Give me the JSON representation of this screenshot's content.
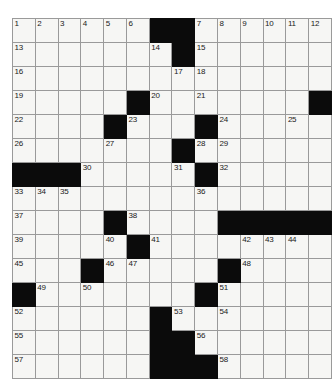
{
  "puzzle": {
    "title": "Crossword Grid",
    "columns": 13,
    "rows": 13,
    "cell_size_px": 24,
    "colors": {
      "block": "#0b0b0b",
      "open_cell": "#f6f6f4",
      "grid_line": "#9a9a9a",
      "number_text": "#1a1a1a",
      "page_background": "#ffffff"
    },
    "max_clue_number": 58,
    "grid": [
      [
        {
          "type": "open",
          "number": "1"
        },
        {
          "type": "open",
          "number": "2"
        },
        {
          "type": "open",
          "number": "3"
        },
        {
          "type": "open",
          "number": "4"
        },
        {
          "type": "open",
          "number": "5"
        },
        {
          "type": "open",
          "number": "6"
        },
        {
          "type": "block",
          "number": ""
        },
        {
          "type": "block",
          "number": ""
        },
        {
          "type": "open",
          "number": "7"
        },
        {
          "type": "open",
          "number": "8"
        },
        {
          "type": "open",
          "number": "9"
        },
        {
          "type": "open",
          "number": "10"
        },
        {
          "type": "open",
          "number": "11"
        },
        {
          "type": "open",
          "number": "12"
        }
      ],
      [
        {
          "type": "open",
          "number": "13"
        },
        {
          "type": "open",
          "number": ""
        },
        {
          "type": "open",
          "number": ""
        },
        {
          "type": "open",
          "number": ""
        },
        {
          "type": "open",
          "number": ""
        },
        {
          "type": "open",
          "number": ""
        },
        {
          "type": "open",
          "number": "14"
        },
        {
          "type": "block",
          "number": ""
        },
        {
          "type": "open",
          "number": "15"
        },
        {
          "type": "open",
          "number": ""
        },
        {
          "type": "open",
          "number": ""
        },
        {
          "type": "open",
          "number": ""
        },
        {
          "type": "open",
          "number": ""
        },
        {
          "type": "open",
          "number": ""
        }
      ],
      [
        {
          "type": "open",
          "number": "16"
        },
        {
          "type": "open",
          "number": ""
        },
        {
          "type": "open",
          "number": ""
        },
        {
          "type": "open",
          "number": ""
        },
        {
          "type": "open",
          "number": ""
        },
        {
          "type": "open",
          "number": ""
        },
        {
          "type": "open",
          "number": ""
        },
        {
          "type": "open",
          "number": "17"
        },
        {
          "type": "open",
          "number": "18"
        },
        {
          "type": "open",
          "number": ""
        },
        {
          "type": "open",
          "number": ""
        },
        {
          "type": "open",
          "number": ""
        },
        {
          "type": "open",
          "number": ""
        },
        {
          "type": "open",
          "number": ""
        }
      ],
      [
        {
          "type": "open",
          "number": "19"
        },
        {
          "type": "open",
          "number": ""
        },
        {
          "type": "open",
          "number": ""
        },
        {
          "type": "open",
          "number": ""
        },
        {
          "type": "open",
          "number": ""
        },
        {
          "type": "block",
          "number": ""
        },
        {
          "type": "open",
          "number": "20"
        },
        {
          "type": "open",
          "number": ""
        },
        {
          "type": "open",
          "number": "21"
        },
        {
          "type": "open",
          "number": ""
        },
        {
          "type": "open",
          "number": ""
        },
        {
          "type": "open",
          "number": ""
        },
        {
          "type": "open",
          "number": ""
        },
        {
          "type": "block",
          "number": ""
        }
      ],
      [
        {
          "type": "open",
          "number": "22"
        },
        {
          "type": "open",
          "number": ""
        },
        {
          "type": "open",
          "number": ""
        },
        {
          "type": "open",
          "number": ""
        },
        {
          "type": "block",
          "number": ""
        },
        {
          "type": "open",
          "number": "23"
        },
        {
          "type": "open",
          "number": ""
        },
        {
          "type": "open",
          "number": ""
        },
        {
          "type": "block",
          "number": ""
        },
        {
          "type": "open",
          "number": "24"
        },
        {
          "type": "open",
          "number": ""
        },
        {
          "type": "open",
          "number": ""
        },
        {
          "type": "open",
          "number": "25"
        },
        {
          "type": "open",
          "number": ""
        }
      ],
      [
        {
          "type": "open",
          "number": "26"
        },
        {
          "type": "open",
          "number": ""
        },
        {
          "type": "open",
          "number": ""
        },
        {
          "type": "open",
          "number": ""
        },
        {
          "type": "open",
          "number": "27"
        },
        {
          "type": "open",
          "number": ""
        },
        {
          "type": "open",
          "number": ""
        },
        {
          "type": "block",
          "number": ""
        },
        {
          "type": "open",
          "number": "28"
        },
        {
          "type": "open",
          "number": "29"
        },
        {
          "type": "open",
          "number": ""
        },
        {
          "type": "open",
          "number": ""
        },
        {
          "type": "open",
          "number": ""
        },
        {
          "type": "open",
          "number": ""
        }
      ],
      [
        {
          "type": "block",
          "number": ""
        },
        {
          "type": "block",
          "number": ""
        },
        {
          "type": "block",
          "number": ""
        },
        {
          "type": "open",
          "number": "30"
        },
        {
          "type": "open",
          "number": ""
        },
        {
          "type": "open",
          "number": ""
        },
        {
          "type": "open",
          "number": ""
        },
        {
          "type": "open",
          "number": "31"
        },
        {
          "type": "block",
          "number": ""
        },
        {
          "type": "open",
          "number": "32"
        },
        {
          "type": "open",
          "number": ""
        },
        {
          "type": "open",
          "number": ""
        },
        {
          "type": "open",
          "number": ""
        },
        {
          "type": "open",
          "number": ""
        }
      ],
      [
        {
          "type": "open",
          "number": "33"
        },
        {
          "type": "open",
          "number": "34"
        },
        {
          "type": "open",
          "number": "35"
        },
        {
          "type": "open",
          "number": ""
        },
        {
          "type": "open",
          "number": ""
        },
        {
          "type": "open",
          "number": ""
        },
        {
          "type": "open",
          "number": ""
        },
        {
          "type": "open",
          "number": ""
        },
        {
          "type": "open",
          "number": "36"
        },
        {
          "type": "open",
          "number": ""
        },
        {
          "type": "open",
          "number": ""
        },
        {
          "type": "open",
          "number": ""
        },
        {
          "type": "open",
          "number": ""
        },
        {
          "type": "open",
          "number": ""
        }
      ],
      [
        {
          "type": "open",
          "number": "37"
        },
        {
          "type": "open",
          "number": ""
        },
        {
          "type": "open",
          "number": ""
        },
        {
          "type": "open",
          "number": ""
        },
        {
          "type": "block",
          "number": ""
        },
        {
          "type": "open",
          "number": "38"
        },
        {
          "type": "open",
          "number": ""
        },
        {
          "type": "open",
          "number": ""
        },
        {
          "type": "open",
          "number": ""
        },
        {
          "type": "block",
          "number": ""
        },
        {
          "type": "block",
          "number": ""
        },
        {
          "type": "block",
          "number": ""
        },
        {
          "type": "block",
          "number": ""
        },
        {
          "type": "block",
          "number": ""
        }
      ],
      [
        {
          "type": "open",
          "number": "39"
        },
        {
          "type": "open",
          "number": ""
        },
        {
          "type": "open",
          "number": ""
        },
        {
          "type": "open",
          "number": ""
        },
        {
          "type": "open",
          "number": "40"
        },
        {
          "type": "block",
          "number": ""
        },
        {
          "type": "open",
          "number": "41"
        },
        {
          "type": "open",
          "number": ""
        },
        {
          "type": "open",
          "number": ""
        },
        {
          "type": "open",
          "number": ""
        },
        {
          "type": "open",
          "number": "42"
        },
        {
          "type": "open",
          "number": "43"
        },
        {
          "type": "open",
          "number": "44"
        },
        {
          "type": "open",
          "number": ""
        }
      ],
      [
        {
          "type": "open",
          "number": "45"
        },
        {
          "type": "open",
          "number": ""
        },
        {
          "type": "open",
          "number": ""
        },
        {
          "type": "block",
          "number": ""
        },
        {
          "type": "open",
          "number": "46"
        },
        {
          "type": "open",
          "number": "47"
        },
        {
          "type": "open",
          "number": ""
        },
        {
          "type": "open",
          "number": ""
        },
        {
          "type": "open",
          "number": ""
        },
        {
          "type": "block",
          "number": ""
        },
        {
          "type": "open",
          "number": "48"
        },
        {
          "type": "open",
          "number": ""
        },
        {
          "type": "open",
          "number": ""
        },
        {
          "type": "open",
          "number": ""
        }
      ],
      [
        {
          "type": "block",
          "number": ""
        },
        {
          "type": "open",
          "number": "49"
        },
        {
          "type": "open",
          "number": ""
        },
        {
          "type": "open",
          "number": "50"
        },
        {
          "type": "open",
          "number": ""
        },
        {
          "type": "open",
          "number": ""
        },
        {
          "type": "open",
          "number": ""
        },
        {
          "type": "open",
          "number": ""
        },
        {
          "type": "block",
          "number": ""
        },
        {
          "type": "open",
          "number": "51"
        },
        {
          "type": "open",
          "number": ""
        },
        {
          "type": "open",
          "number": ""
        },
        {
          "type": "open",
          "number": ""
        },
        {
          "type": "open",
          "number": ""
        }
      ],
      [
        {
          "type": "open",
          "number": "52"
        },
        {
          "type": "open",
          "number": ""
        },
        {
          "type": "open",
          "number": ""
        },
        {
          "type": "open",
          "number": ""
        },
        {
          "type": "open",
          "number": ""
        },
        {
          "type": "open",
          "number": ""
        },
        {
          "type": "block",
          "number": ""
        },
        {
          "type": "open",
          "number": "53"
        },
        {
          "type": "open",
          "number": ""
        },
        {
          "type": "open",
          "number": "54"
        },
        {
          "type": "open",
          "number": ""
        },
        {
          "type": "open",
          "number": ""
        },
        {
          "type": "open",
          "number": ""
        },
        {
          "type": "open",
          "number": ""
        }
      ],
      [
        {
          "type": "open",
          "number": "55"
        },
        {
          "type": "open",
          "number": ""
        },
        {
          "type": "open",
          "number": ""
        },
        {
          "type": "open",
          "number": ""
        },
        {
          "type": "open",
          "number": ""
        },
        {
          "type": "open",
          "number": ""
        },
        {
          "type": "block",
          "number": ""
        },
        {
          "type": "block",
          "number": ""
        },
        {
          "type": "open",
          "number": "56"
        },
        {
          "type": "open",
          "number": ""
        },
        {
          "type": "open",
          "number": ""
        },
        {
          "type": "open",
          "number": ""
        },
        {
          "type": "open",
          "number": ""
        },
        {
          "type": "open",
          "number": ""
        }
      ],
      [
        {
          "type": "open",
          "number": "57"
        },
        {
          "type": "open",
          "number": ""
        },
        {
          "type": "open",
          "number": ""
        },
        {
          "type": "open",
          "number": ""
        },
        {
          "type": "open",
          "number": ""
        },
        {
          "type": "open",
          "number": ""
        },
        {
          "type": "block",
          "number": ""
        },
        {
          "type": "block",
          "number": ""
        },
        {
          "type": "block",
          "number": ""
        },
        {
          "type": "open",
          "number": "58"
        },
        {
          "type": "open",
          "number": ""
        },
        {
          "type": "open",
          "number": ""
        },
        {
          "type": "open",
          "number": ""
        },
        {
          "type": "open",
          "number": ""
        }
      ]
    ]
  }
}
